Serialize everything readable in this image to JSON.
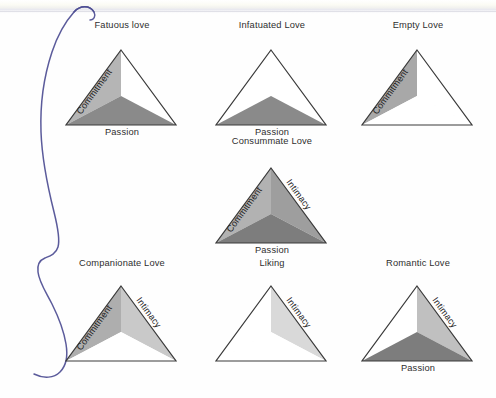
{
  "page": {
    "background_color": "#fefefe",
    "annotation": {
      "type": "hand-drawn-brace",
      "color": "#4a4a8f",
      "description": "blue ink curly brace grouping all triangles"
    }
  },
  "legend": {
    "components": [
      "Commitment",
      "Intimacy",
      "Passion"
    ],
    "shade_dark": "#6e6e6e",
    "shade_mid": "#8d8d8d",
    "shade_light": "#b9b9b9",
    "shade_pale": "#d8d8d8",
    "outline": "#3a3a3a",
    "unfilled": "#ffffff"
  },
  "axis_labels": {
    "commitment": "Commitment",
    "intimacy": "Intimacy",
    "passion": "Passion"
  },
  "figures": [
    {
      "id": "fatuous-love",
      "title": "Fatuous love",
      "row": "top",
      "column": 1,
      "filled": [
        "Commitment",
        "Passion"
      ],
      "empty": [
        "Intimacy"
      ],
      "side_labels": [
        "Commitment"
      ],
      "base_label": "Passion"
    },
    {
      "id": "infatuated-love",
      "title": "Infatuated Love",
      "row": "top",
      "column": 2,
      "filled": [
        "Passion"
      ],
      "empty": [
        "Commitment",
        "Intimacy"
      ],
      "side_labels": [],
      "base_label": "Passion"
    },
    {
      "id": "empty-love",
      "title": "Empty Love",
      "row": "top",
      "column": 3,
      "filled": [
        "Commitment"
      ],
      "empty": [
        "Intimacy",
        "Passion"
      ],
      "side_labels": [
        "Commitment"
      ],
      "base_label": ""
    },
    {
      "id": "consummate-love",
      "title": "Consummate Love",
      "row": "middle",
      "column": 2,
      "filled": [
        "Commitment",
        "Intimacy",
        "Passion"
      ],
      "empty": [],
      "side_labels": [
        "Commitment",
        "Intimacy"
      ],
      "base_label": "Passion"
    },
    {
      "id": "companionate-love",
      "title": "Companionate Love",
      "row": "bottom",
      "column": 1,
      "filled": [
        "Commitment",
        "Intimacy"
      ],
      "empty": [
        "Passion"
      ],
      "side_labels": [
        "Commitment",
        "Intimacy"
      ],
      "base_label": ""
    },
    {
      "id": "liking",
      "title": "Liking",
      "row": "bottom",
      "column": 2,
      "filled": [
        "Intimacy"
      ],
      "empty": [
        "Commitment",
        "Passion"
      ],
      "side_labels": [
        "Intimacy"
      ],
      "base_label": ""
    },
    {
      "id": "romantic-love",
      "title": "Romantic Love",
      "row": "bottom",
      "column": 3,
      "filled": [
        "Intimacy",
        "Passion"
      ],
      "empty": [
        "Commitment"
      ],
      "side_labels": [
        "Intimacy"
      ],
      "base_label": "Passion"
    }
  ],
  "footer": {
    "caption": ""
  }
}
